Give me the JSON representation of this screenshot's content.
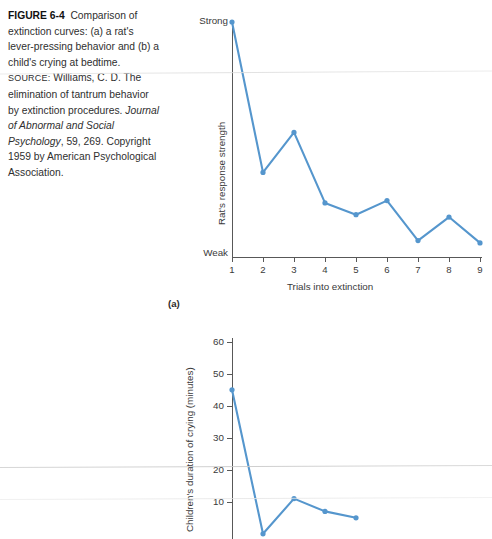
{
  "caption": {
    "figure_number": "FIGURE 6-4",
    "title_text": "Comparison of extinction curves: (a) a rat's lever-pressing behavior and (b) a child's crying at bedtime.",
    "source_label": "SOURCE:",
    "source_text_1": "Williams, C. D. The elimination of tantrum behavior by extinction procedures. ",
    "source_journal": "Journal of Abnormal and Social Psychology",
    "source_text_2": ", 59, 269. Copyright 1959 by  American Psychological Association."
  },
  "colors": {
    "line": "#5596cd",
    "marker": "#4a90c8",
    "axis": "#585858",
    "text": "#3a3a3a"
  },
  "chart_data": [
    {
      "type": "line",
      "panel": "(a)",
      "title": "",
      "xlabel": "Trials into extinction",
      "ylabel": "Rat's response strength",
      "x": [
        1,
        2,
        3,
        4,
        5,
        6,
        7,
        8,
        9
      ],
      "xticklabels": [
        "1",
        "2",
        "3",
        "4",
        "5",
        "6",
        "7",
        "8",
        "9"
      ],
      "yticklabels": [
        "Strong",
        "Weak"
      ],
      "ylim": [
        0,
        100
      ],
      "ylim_labels": [
        "Weak",
        "Strong"
      ],
      "values": [
        100,
        36,
        53,
        23,
        18,
        24,
        7,
        17,
        6
      ],
      "grid": false,
      "legend": "none",
      "markers": true
    },
    {
      "type": "line",
      "panel": "(b)",
      "title": "",
      "xlabel": "",
      "ylabel": "Children's duration of crying (minutes)",
      "x": [
        1,
        2,
        3,
        4,
        5
      ],
      "yticklabels": [
        "10",
        "20",
        "30",
        "40",
        "50",
        "60"
      ],
      "yticks": [
        10,
        20,
        30,
        40,
        50,
        60
      ],
      "ylim": [
        0,
        62
      ],
      "values": [
        45,
        0,
        11,
        7,
        5
      ],
      "grid": false,
      "legend": "none",
      "markers": true,
      "note": "chart is cropped at the bottom edge of the screenshot"
    }
  ]
}
